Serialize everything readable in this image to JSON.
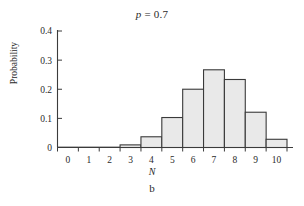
{
  "figure": {
    "title_prefix": "p",
    "title_rest": " = 0.7",
    "ylabel": "Probability",
    "xlabel": "N",
    "caption": "b"
  },
  "chart_data": {
    "type": "bar",
    "title": "p = 0.7",
    "xlabel": "N",
    "ylabel": "Probability",
    "categories": [
      "0",
      "1",
      "2",
      "3",
      "4",
      "5",
      "6",
      "7",
      "8",
      "9",
      "10"
    ],
    "values": [
      0.0,
      0.0001,
      0.0014,
      0.009,
      0.0368,
      0.1029,
      0.2001,
      0.2668,
      0.2335,
      0.1211,
      0.0282
    ],
    "xlim": [
      -0.5,
      10.5
    ],
    "ylim": [
      0,
      0.4
    ],
    "ytick_labels": [
      "0",
      "0.1",
      "0.2",
      "0.3",
      "0.4"
    ],
    "ytick_values": [
      0,
      0.1,
      0.2,
      0.3,
      0.4
    ],
    "xtick_labels": [
      "0",
      "1",
      "2",
      "3",
      "4",
      "5",
      "6",
      "7",
      "8",
      "9",
      "10"
    ],
    "grid": false,
    "legend": "none",
    "bar_fill": "#e9e9e9",
    "bar_edge": "#3a3a3a"
  }
}
